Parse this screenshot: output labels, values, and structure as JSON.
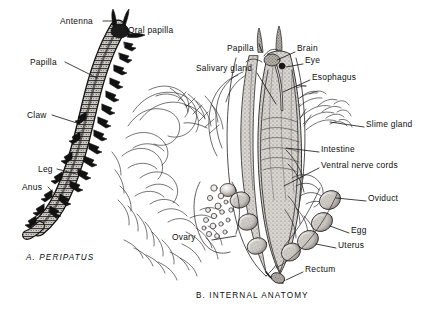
{
  "figure": {
    "background_color": "#ffffff",
    "ink_color": "#111111",
    "panels": [
      {
        "id": "A",
        "caption": "A.  PERIPATUS",
        "italic": true
      },
      {
        "id": "B",
        "caption": "B.  INTERNAL  ANATOMY",
        "italic": false
      }
    ]
  },
  "panel_a": {
    "subject": "peripatus-whole-body",
    "labels": [
      {
        "text": "Antenna",
        "x": 60,
        "y": 17,
        "leader": "right"
      },
      {
        "text": "Oral  papilla",
        "x": 128,
        "y": 26,
        "leader": "left"
      },
      {
        "text": "Papilla",
        "x": 30,
        "y": 58,
        "leader": "right"
      },
      {
        "text": "Claw",
        "x": 27,
        "y": 111,
        "leader": "right"
      },
      {
        "text": "Leg",
        "x": 38,
        "y": 165,
        "leader": "right"
      },
      {
        "text": "Anus",
        "x": 22,
        "y": 183,
        "leader": "right"
      }
    ]
  },
  "panel_b": {
    "subject": "peripatus-internal-anatomy",
    "labels": [
      {
        "text": "Papilla",
        "x": 227,
        "y": 48,
        "leader": "right"
      },
      {
        "text": "Brain",
        "x": 297,
        "y": 48,
        "leader": "left"
      },
      {
        "text": "Eye",
        "x": 305,
        "y": 60,
        "leader": "left"
      },
      {
        "text": "Salivary gland",
        "x": 196,
        "y": 67,
        "leader": "right"
      },
      {
        "text": "Esophagus",
        "x": 312,
        "y": 76,
        "leader": "left"
      },
      {
        "text": "Slime gland",
        "x": 366,
        "y": 123,
        "leader": "left"
      },
      {
        "text": "Intestine",
        "x": 321,
        "y": 148,
        "leader": "left"
      },
      {
        "text": "Ventral nerve cords",
        "x": 321,
        "y": 164,
        "leader": "left"
      },
      {
        "text": "Oviduct",
        "x": 368,
        "y": 197,
        "leader": "left"
      },
      {
        "text": "Ovary",
        "x": 172,
        "y": 236,
        "leader": "right"
      },
      {
        "text": "Egg",
        "x": 351,
        "y": 229,
        "leader": "left"
      },
      {
        "text": "Uterus",
        "x": 338,
        "y": 244,
        "leader": "left"
      },
      {
        "text": "Rectum",
        "x": 305,
        "y": 268,
        "leader": "left"
      }
    ]
  }
}
